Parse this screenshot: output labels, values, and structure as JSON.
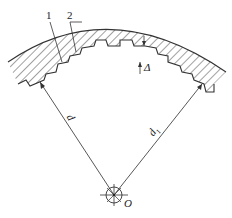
{
  "diagram": {
    "labels": {
      "part1": "1",
      "part2": "2",
      "gap": "Δ",
      "diameter_d": "d",
      "diameter_d1": "d",
      "diameter_d1_sub": "1",
      "center": "O"
    },
    "colors": {
      "line": "#333333",
      "hatch": "#444444",
      "background": "#ffffff"
    }
  }
}
